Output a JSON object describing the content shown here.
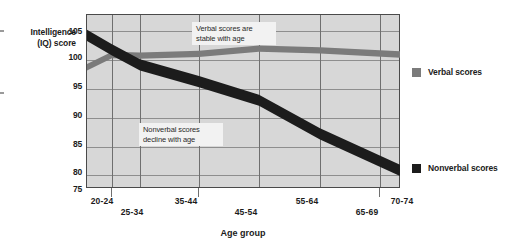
{
  "chart_data": {
    "type": "line",
    "title": "",
    "xlabel": "Age group",
    "ylabel": "Intelligence (IQ) score",
    "ylabel_line1": "Intelligence",
    "ylabel_line2": "(IQ) score",
    "categories": [
      "20-24",
      "25-34",
      "35-44",
      "45-54",
      "55-64",
      "65-69",
      "70-74"
    ],
    "yticks": [
      105,
      100,
      95,
      90,
      85,
      80,
      75
    ],
    "ylim": [
      75,
      105
    ],
    "grid": true,
    "legend_position": "right",
    "series": [
      {
        "name": "Verbal scores",
        "color": "#7b7b7b",
        "values": [
          96.0,
          98.1,
          98.0,
          98.3,
          99.2,
          98.9,
          98.2
        ]
      },
      {
        "name": "Nonverbal scores",
        "color": "#1c1c1c",
        "values": [
          101.5,
          99.0,
          96.4,
          93.5,
          90.3,
          84.5,
          78.2
        ]
      }
    ],
    "annotations": [
      {
        "text": "Verbal scores are\nstable with age"
      },
      {
        "text": "Nonverbal scores\ndecline with age"
      }
    ]
  },
  "legend": {
    "items": [
      {
        "label": "Verbal scores",
        "color": "#7b7b7b"
      },
      {
        "label": "Nonverbal scores",
        "color": "#1c1c1c"
      }
    ]
  }
}
